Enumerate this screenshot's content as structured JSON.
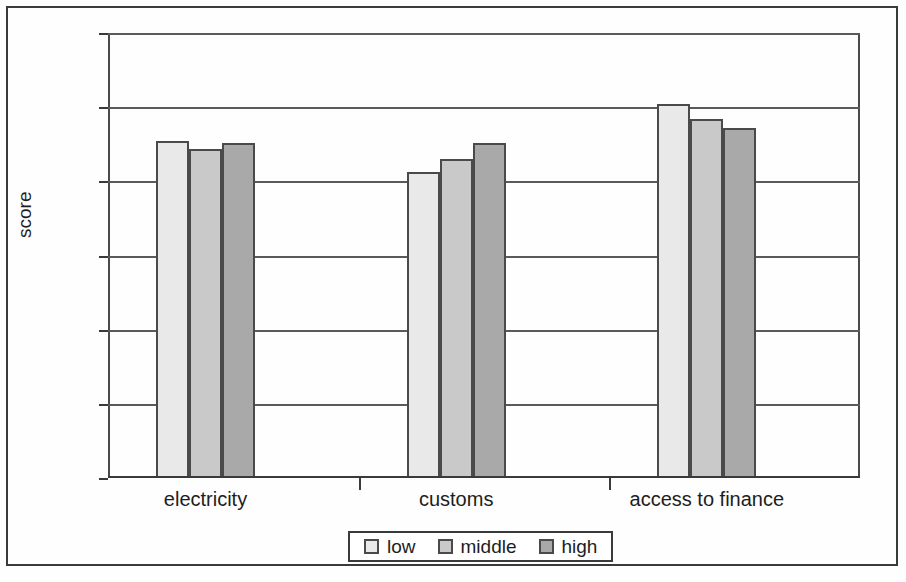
{
  "chart_data": {
    "type": "bar",
    "title": "",
    "xlabel": "",
    "ylabel": "score",
    "categories": [
      "electricity",
      "customs",
      "access to finance"
    ],
    "series": [
      {
        "name": "low",
        "values": [
          2.27,
          2.06,
          2.52
        ],
        "color": "#e9e9e9"
      },
      {
        "name": "middle",
        "values": [
          2.22,
          2.15,
          2.42
        ],
        "color": "#c9c9c9"
      },
      {
        "name": "high",
        "values": [
          2.26,
          2.26,
          2.36
        ],
        "color": "#a9a9a9"
      }
    ],
    "ylim": [
      0,
      3
    ],
    "ytick_labels": [
      "3",
      "2.5",
      "2",
      "1.5",
      "1",
      "0.5",
      "0"
    ],
    "ytick_values": [
      3,
      2.5,
      2,
      1.5,
      1,
      0.5,
      0
    ],
    "grid": true,
    "legend_position": "bottom",
    "legend_entries": [
      "low",
      "middle",
      "high"
    ]
  },
  "axis": {
    "y_title": "score",
    "ticks": [
      {
        "label": "3",
        "value": 3
      },
      {
        "label": "2.5",
        "value": 2.5
      },
      {
        "label": "2",
        "value": 2
      },
      {
        "label": "1.5",
        "value": 1.5
      },
      {
        "label": "1",
        "value": 1
      },
      {
        "label": "0.5",
        "value": 0.5
      },
      {
        "label": "0",
        "value": 0
      }
    ]
  },
  "x_categories": [
    {
      "label": "electricity"
    },
    {
      "label": "customs"
    },
    {
      "label": "access to finance"
    }
  ],
  "legend": {
    "items": [
      {
        "label": "low"
      },
      {
        "label": "middle"
      },
      {
        "label": "high"
      }
    ]
  }
}
